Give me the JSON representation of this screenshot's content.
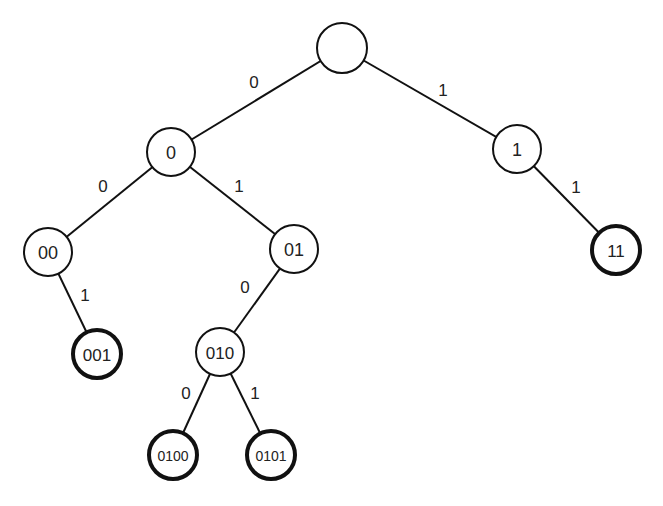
{
  "diagram": {
    "type": "binary-trie",
    "colors": {
      "stroke": "#111111",
      "text": "#222222",
      "background": "#ffffff"
    },
    "nodes": [
      {
        "id": "root",
        "label": "",
        "x": 342,
        "y": 48,
        "r": 25,
        "terminal": false,
        "font_size": 18
      },
      {
        "id": "n0",
        "label": "0",
        "x": 171,
        "y": 152,
        "r": 24,
        "terminal": false,
        "font_size": 18
      },
      {
        "id": "n1",
        "label": "1",
        "x": 517,
        "y": 149,
        "r": 24,
        "terminal": false,
        "font_size": 18
      },
      {
        "id": "n00",
        "label": "00",
        "x": 48,
        "y": 252,
        "r": 24,
        "terminal": false,
        "font_size": 18
      },
      {
        "id": "n01",
        "label": "01",
        "x": 294,
        "y": 249,
        "r": 24,
        "terminal": false,
        "font_size": 18
      },
      {
        "id": "n11",
        "label": "11",
        "x": 616,
        "y": 250,
        "r": 24,
        "terminal": true,
        "font_size": 17
      },
      {
        "id": "n001",
        "label": "001",
        "x": 97,
        "y": 354,
        "r": 24,
        "terminal": true,
        "font_size": 17
      },
      {
        "id": "n010",
        "label": "010",
        "x": 220,
        "y": 352,
        "r": 24,
        "terminal": false,
        "font_size": 17
      },
      {
        "id": "n0100",
        "label": "0100",
        "x": 173,
        "y": 455,
        "r": 24,
        "terminal": true,
        "font_size": 14
      },
      {
        "id": "n0101",
        "label": "0101",
        "x": 271,
        "y": 455,
        "r": 24,
        "terminal": true,
        "font_size": 14
      }
    ],
    "edges": [
      {
        "from": "root",
        "to": "n0",
        "label": "0",
        "label_x": 254,
        "label_y": 82
      },
      {
        "from": "root",
        "to": "n1",
        "label": "1",
        "label_x": 443,
        "label_y": 90
      },
      {
        "from": "n0",
        "to": "n00",
        "label": "0",
        "label_x": 103,
        "label_y": 186
      },
      {
        "from": "n0",
        "to": "n01",
        "label": "1",
        "label_x": 239,
        "label_y": 186
      },
      {
        "from": "n1",
        "to": "n11",
        "label": "1",
        "label_x": 576,
        "label_y": 187
      },
      {
        "from": "n00",
        "to": "n001",
        "label": "1",
        "label_x": 85,
        "label_y": 295
      },
      {
        "from": "n01",
        "to": "n010",
        "label": "0",
        "label_x": 245,
        "label_y": 287
      },
      {
        "from": "n010",
        "to": "n0100",
        "label": "0",
        "label_x": 186,
        "label_y": 393
      },
      {
        "from": "n010",
        "to": "n0101",
        "label": "1",
        "label_x": 255,
        "label_y": 393
      }
    ]
  }
}
